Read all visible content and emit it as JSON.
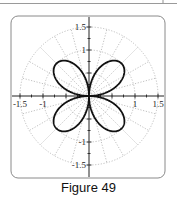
{
  "caption": "Figure 49",
  "chart_data": {
    "type": "line",
    "coordinate_system": "polar",
    "title": "",
    "caption": "Figure 49",
    "equation": "r = sin(2θ)",
    "xlabel": "",
    "ylabel": "",
    "xlim": [
      -1.7,
      1.7
    ],
    "ylim": [
      -1.7,
      1.7
    ],
    "x_ticks": [
      "-1.5",
      "-1",
      "1",
      "1.5"
    ],
    "y_ticks": [
      "1.5",
      "1",
      "-1",
      "-1.5"
    ],
    "grid": {
      "type": "polar",
      "circles": [
        0.5,
        1,
        1.5
      ],
      "radial_step_deg": 15,
      "style": "dotted"
    },
    "series": [
      {
        "name": "r = sin(2θ)",
        "petal_tips": [
          [
            0.707,
            0.707
          ],
          [
            -0.707,
            0.707
          ],
          [
            -0.707,
            -0.707
          ],
          [
            0.707,
            -0.707
          ]
        ],
        "max_r": 1
      }
    ]
  },
  "colors": {
    "curve": "#111111",
    "grid": "#b0b0b0",
    "axis": "#222222",
    "frame": "#8a8a8a"
  }
}
